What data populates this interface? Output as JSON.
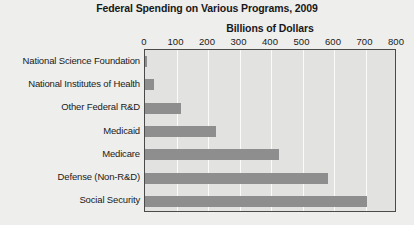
{
  "chart_data": {
    "type": "bar",
    "orientation": "horizontal",
    "title": "Federal Spending on Various Programs, 2009",
    "xlabel": "Billions of Dollars",
    "ylabel": "",
    "xlim": [
      0,
      800
    ],
    "xticks": [
      0,
      100,
      200,
      300,
      400,
      500,
      600,
      700,
      800
    ],
    "xtick_labels": [
      "0",
      "100",
      "200",
      "300",
      "400",
      "500",
      "600",
      "700",
      "800"
    ],
    "grid": true,
    "grid_axis": "x",
    "legend": false,
    "categories": [
      "National Science Foundation",
      "National Institutes of Health",
      "Other Federal R&D",
      "Medicaid",
      "Medicare",
      "Defense (Non-R&D)",
      "Social Security"
    ],
    "values": [
      7,
      30,
      115,
      225,
      425,
      580,
      705
    ],
    "bar_color": "#8e8e8e",
    "plot_background": "#e2e2e0",
    "gridline_color": "#fbfbfa",
    "border_color": "#4a4a4a",
    "text_color": "#1a1a1a"
  }
}
